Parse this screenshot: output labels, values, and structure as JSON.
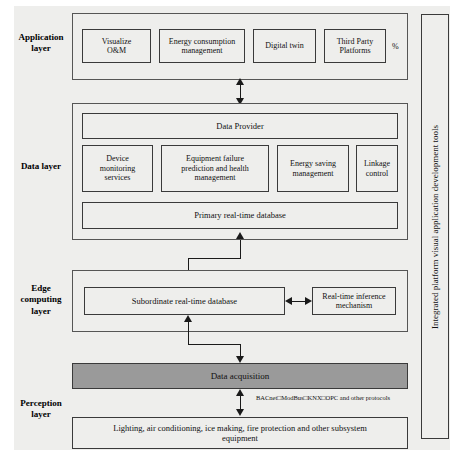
{
  "diagram": {
    "side_band_label": "Integrated platform visual application development tools",
    "layers": [
      {
        "id": "application",
        "label": "Application\nlayer"
      },
      {
        "id": "data",
        "label": "Data layer"
      },
      {
        "id": "edge",
        "label": "Edge\ncomputing\nlayer"
      },
      {
        "id": "perception",
        "label": "Perception\nlayer"
      }
    ],
    "application_layer": {
      "label": "Application layer",
      "boxes": [
        {
          "label": "Visualize\nO&M"
        },
        {
          "label": "Energy consumption\nmanagement"
        },
        {
          "label": "Digital twin"
        },
        {
          "label": "Third Party\nPlatforms"
        }
      ],
      "trailing_mark": "%"
    },
    "data_layer": {
      "label": "Data layer",
      "provider": "Data Provider",
      "services": [
        {
          "label": "Device\nmonitoring\nservices"
        },
        {
          "label": "Equipment failure\nprediction and health\nmanagement"
        },
        {
          "label": "Energy saving\nmanagement"
        },
        {
          "label": "Linkage\ncontrol"
        }
      ],
      "database": "Primary real-time database"
    },
    "edge_layer": {
      "label": "Edge computing layer",
      "database": "Subordinate real-time database",
      "inference": "Real-time inference\nmechanism"
    },
    "perception_layer": {
      "label": "Perception layer",
      "acquisition": "Data acquisition",
      "protocols": "BACnet□ModBus□KNX□OPC and other protocols",
      "equipment": "Lighting, air conditioning, ice making, fire protection and other subsystem\nequipment"
    },
    "colors": {
      "page_background": "#eeeeec",
      "box_fill": "#eeeeec",
      "box_border": "#3a3a3a",
      "acquisition_fill": "#9a9a9a",
      "connector": "#1a1a1a",
      "text": "#111111"
    }
  }
}
